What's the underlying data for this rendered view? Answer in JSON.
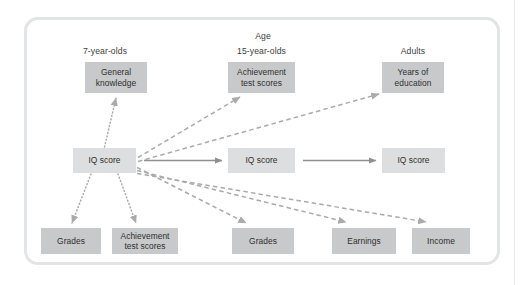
{
  "figure": {
    "title_row": {
      "age_label": "Age",
      "columns": [
        {
          "id": "col-7",
          "label": "7-year-olds"
        },
        {
          "id": "col-15",
          "label": "15-year-olds"
        },
        {
          "id": "col-adults",
          "label": "Adults"
        }
      ]
    },
    "nodes": [
      {
        "id": "general-knowledge",
        "label": "General\nknowledge",
        "shade": "dark",
        "x": 85,
        "y": 62,
        "w": 62,
        "h": 31
      },
      {
        "id": "achievement-15",
        "label": "Achievement\ntest scores",
        "shade": "dark",
        "x": 228,
        "y": 62,
        "w": 67,
        "h": 31
      },
      {
        "id": "years-of-education",
        "label": "Years of\neducation",
        "shade": "dark",
        "x": 382,
        "y": 62,
        "w": 62,
        "h": 31
      },
      {
        "id": "iq-score-7",
        "label": "IQ score",
        "shade": "light",
        "x": 73,
        "y": 148,
        "w": 63,
        "h": 25
      },
      {
        "id": "iq-score-15",
        "label": "IQ score",
        "shade": "light",
        "x": 228,
        "y": 148,
        "w": 67,
        "h": 25
      },
      {
        "id": "iq-score-adult",
        "label": "IQ score",
        "shade": "light",
        "x": 382,
        "y": 148,
        "w": 63,
        "h": 25
      },
      {
        "id": "grades-7",
        "label": "Grades",
        "shade": "dark",
        "x": 41,
        "y": 228,
        "w": 60,
        "h": 26
      },
      {
        "id": "achievement-7",
        "label": "Achievement\ntest scores",
        "shade": "dark",
        "x": 112,
        "y": 228,
        "w": 66,
        "h": 26
      },
      {
        "id": "grades-15",
        "label": "Grades",
        "shade": "dark",
        "x": 232,
        "y": 228,
        "w": 62,
        "h": 26
      },
      {
        "id": "earnings-adult",
        "label": "Earnings",
        "shade": "dark",
        "x": 332,
        "y": 228,
        "w": 64,
        "h": 26
      },
      {
        "id": "income-adult",
        "label": "Income",
        "shade": "dark",
        "x": 412,
        "y": 228,
        "w": 58,
        "h": 26
      }
    ],
    "edges": [
      {
        "id": "edge-iq7-to-general-knowledge",
        "from": "iq-score-7",
        "to": "general-knowledge",
        "style": "dotted"
      },
      {
        "id": "edge-iq7-to-grades-7",
        "from": "iq-score-7",
        "to": "grades-7",
        "style": "dotted"
      },
      {
        "id": "edge-iq7-to-achievement-7",
        "from": "iq-score-7",
        "to": "achievement-7",
        "style": "dotted"
      },
      {
        "id": "edge-iq7-to-iq15",
        "from": "iq-score-7",
        "to": "iq-score-15",
        "style": "solid"
      },
      {
        "id": "edge-iq15-to-iqadult",
        "from": "iq-score-15",
        "to": "iq-score-adult",
        "style": "solid"
      },
      {
        "id": "edge-iq7-to-achievement-15",
        "from": "iq-score-7",
        "to": "achievement-15",
        "style": "dashed"
      },
      {
        "id": "edge-iq7-to-years-of-education",
        "from": "iq-score-7",
        "to": "years-of-education",
        "style": "dashed"
      },
      {
        "id": "edge-iq7-to-grades-15",
        "from": "iq-score-7",
        "to": "grades-15",
        "style": "dashed"
      },
      {
        "id": "edge-iq7-to-earnings",
        "from": "iq-score-7",
        "to": "earnings-adult",
        "style": "dashed"
      },
      {
        "id": "edge-iq7-to-income",
        "from": "iq-score-7",
        "to": "income-adult",
        "style": "dashed"
      }
    ],
    "colors": {
      "box_dark": "#c8c9cb",
      "box_light": "#dddedf",
      "frame_border": "#e3e4e6",
      "arrow": "#a9aaac",
      "solid_arrow": "#8e8f91",
      "text": "#2e2e2e",
      "background": "#ffffff"
    }
  }
}
